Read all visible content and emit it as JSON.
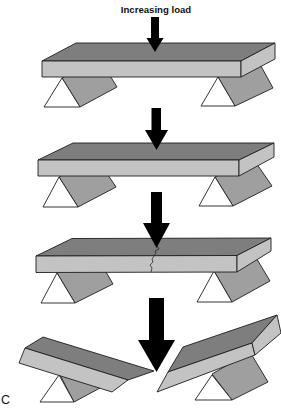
{
  "figure": {
    "load_label": "Increasing load",
    "panel_label": "C"
  },
  "colors": {
    "beam_top": "#7e7e7e",
    "beam_front": "#c3c3c3",
    "support_block": "#9f9f9f",
    "support_triangle": "#ffffff",
    "arrow": "#000000"
  },
  "stages": [
    {
      "id": 1,
      "state": "intact",
      "arrow_size": "small"
    },
    {
      "id": 2,
      "state": "intact",
      "arrow_size": "small"
    },
    {
      "id": 3,
      "state": "cracked",
      "arrow_size": "medium"
    },
    {
      "id": 4,
      "state": "fractured",
      "arrow_size": "large"
    }
  ]
}
